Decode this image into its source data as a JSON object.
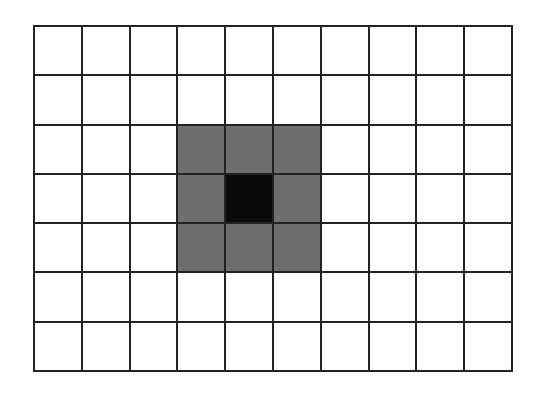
{
  "diagram": {
    "type": "pixel-grid",
    "columns": 10,
    "rows": 7,
    "colors": {
      "empty": "#ffffff",
      "neighbor": "#6e6e6e",
      "center": "#0a0a0a",
      "line": "#222222"
    },
    "cells": [
      [
        0,
        0,
        0,
        0,
        0,
        0,
        0,
        0,
        0,
        0
      ],
      [
        0,
        0,
        0,
        0,
        0,
        0,
        0,
        0,
        0,
        0
      ],
      [
        0,
        0,
        0,
        1,
        1,
        1,
        0,
        0,
        0,
        0
      ],
      [
        0,
        0,
        0,
        1,
        2,
        1,
        0,
        0,
        0,
        0
      ],
      [
        0,
        0,
        0,
        1,
        1,
        1,
        0,
        0,
        0,
        0
      ],
      [
        0,
        0,
        0,
        0,
        0,
        0,
        0,
        0,
        0,
        0
      ],
      [
        0,
        0,
        0,
        0,
        0,
        0,
        0,
        0,
        0,
        0
      ]
    ],
    "legend": {
      "0": "empty",
      "1": "neighbor",
      "2": "center"
    }
  }
}
